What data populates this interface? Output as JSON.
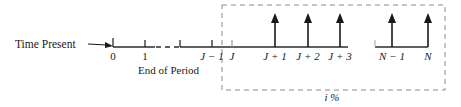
{
  "figure": {
    "type": "cash-flow-diagram",
    "title_text": "",
    "colors": {
      "ink": "#1a1a1a",
      "axis": "#2b2b2b",
      "dashed_box": "#8a8a8a",
      "background": "#ffffff"
    },
    "annotations": {
      "time_present_label": "Time Present",
      "end_of_period_label": "End of Period",
      "interest_rate_label": "i %"
    },
    "axis": {
      "baseline_y": 47,
      "start_x": 113,
      "end_x": 428,
      "segments": [
        {
          "from_x": 113,
          "to_x": 155,
          "style": "solid"
        },
        {
          "from_x": 155,
          "to_x": 180,
          "style": "dashed"
        },
        {
          "from_x": 180,
          "to_x": 348,
          "style": "solid"
        },
        {
          "from_x": 348,
          "to_x": 375,
          "style": "gap"
        },
        {
          "from_x": 375,
          "to_x": 428,
          "style": "solid"
        }
      ]
    },
    "periods": [
      {
        "id": "p0",
        "label": "0",
        "x": 113,
        "tick": "down",
        "arrow": false
      },
      {
        "id": "p1",
        "label": "1",
        "x": 145,
        "tick": "down",
        "arrow": false
      },
      {
        "id": "pJm1",
        "label": "J − 1",
        "x": 212,
        "tick": "down",
        "arrow": false,
        "tick2_x": 180
      },
      {
        "id": "pJ",
        "label": "J",
        "x": 232,
        "tick": "down",
        "arrow": false
      },
      {
        "id": "pJ1",
        "label": "J + 1",
        "x": 275,
        "tick": "none",
        "arrow": true
      },
      {
        "id": "pJ2",
        "label": "J + 2",
        "x": 308,
        "tick": "none",
        "arrow": true
      },
      {
        "id": "pJ3",
        "label": "J + 3",
        "x": 340,
        "tick": "none",
        "arrow": true
      },
      {
        "id": "pNm1",
        "label": "N − 1",
        "x": 392,
        "tick": "none",
        "arrow": true
      },
      {
        "id": "pN",
        "label": "N",
        "x": 428,
        "tick": "none",
        "arrow": true
      }
    ],
    "arrows": {
      "direction": "up",
      "tip_y": 14,
      "base_y": 47,
      "count": 5
    },
    "dashed_box": {
      "left": 222,
      "top": 5,
      "right": 445,
      "bottom": 90
    },
    "pointer": {
      "from_x": 88,
      "to_x": 112,
      "y": 45,
      "style": "dashed-arrow-right"
    },
    "break_marks": [
      {
        "x_from": 155,
        "x_to": 180,
        "kind": "axis-dash-break"
      },
      {
        "x_from": 348,
        "x_to": 375,
        "kind": "axis-gap-break"
      }
    ]
  }
}
